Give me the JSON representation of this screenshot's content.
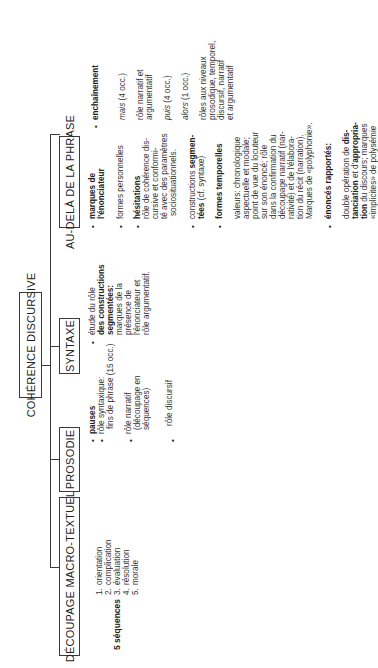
{
  "diagram": {
    "title": "COHÉRENCE DISCURSIVE",
    "branches": [
      {
        "id": "decoupage",
        "label": "DÉCOUPAGE MACRO-TEXTUEL",
        "sequences_label": "5 séquences",
        "items": [
          {
            "num": "1.",
            "text": "orientation"
          },
          {
            "num": "2.",
            "text": "complication"
          },
          {
            "num": "3.",
            "text": "évaluation"
          },
          {
            "num": "4.",
            "text": "résolution"
          },
          {
            "num": "5.",
            "text": "morale"
          }
        ]
      },
      {
        "id": "prosodie",
        "label": "PROSODIE",
        "items": [
          {
            "lines": [
              "pauses"
            ],
            "bold": true
          },
          {
            "lines": [
              "rôle syntaxique:",
              "fins de phrase (15 occ.)"
            ]
          },
          {
            "lines": [
              "rôle narratif",
              "(découpage en",
              "séquences)"
            ]
          },
          {
            "lines": [
              "rôle discursif"
            ]
          }
        ]
      },
      {
        "id": "syntaxe",
        "label": "SYNTAXE",
        "items": [
          {
            "lines": [
              "étude du rôle",
              "des constructions",
              "segmentées:",
              "marques de la",
              "présence de",
              "l'énonciateur et",
              "rôle argumentatif."
            ]
          }
        ]
      },
      {
        "id": "au-dela",
        "label": "AU-DELÀ DE LA PHRASE",
        "left_column": [
          {
            "heading": [
              "marques de",
              "l'énonciateur"
            ]
          },
          {
            "lines": [
              "formes personnelles"
            ]
          },
          {
            "heading": [
              "hésitations"
            ],
            "lines": [
              "rôle de cohérence dis-",
              "cursive et conformi-",
              "té avec des paramètres",
              "sociosituationnels."
            ]
          },
          {
            "lines": [
              "constructions segmen-",
              "tées (cf. syntaxe)"
            ]
          },
          {
            "heading": [
              "formes temporelles"
            ],
            "lines": [
              "valeurs: chronologique",
              "aspectuelle et modale;",
              "point de vue du locuteur",
              "sur son énoncé; rôle",
              "dans la confirmation du",
              "découpage narratif (nar-",
              "rativité) et de l'élabora-",
              "tion du récit (narration).",
              "Marques de «polyphonie»."
            ]
          },
          {
            "heading": [
              "énoncés rapportés:"
            ],
            "lines": [
              "double opération de dis-",
              "tanciation et d'appropria-",
              "tion du discours; marques",
              "«implicites» de polysémie"
            ]
          }
        ],
        "right_column": {
          "heading": "enchaînement",
          "entries": [
            {
              "text": "mais (4 occ.)",
              "italic_word": "mais",
              "rest": " (4 occ.)"
            },
            {
              "lines": [
                "rôle narratif et",
                "argumentatif"
              ]
            },
            {
              "text": "puis (4 occ.)",
              "italic_word": "puis",
              "rest": " (4 occ.)"
            },
            {
              "text": "alors (1 occ.)",
              "italic_word": "alors",
              "rest": " (1 occ.)"
            },
            {
              "lines": [
                "rôles aux niveaux",
                "prosodique, temporel,",
                "discursif, narratif",
                "et argumentatif"
              ]
            }
          ]
        }
      }
    ],
    "bullet": "•"
  }
}
